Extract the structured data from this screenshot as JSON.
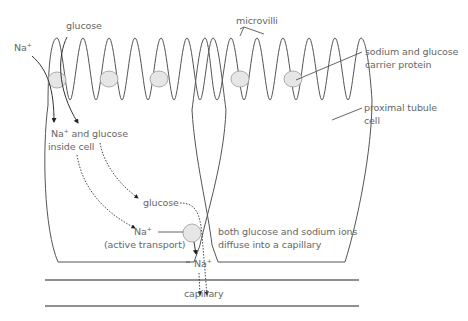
{
  "diagram": {
    "labels": {
      "glucose_top": "glucose",
      "na_top": "Na",
      "microvilli": "microvilli",
      "carrier_protein_line1": "sodium and glucose",
      "carrier_protein_line2": "carrier protein",
      "proximal_cell_line1": "proximal tubule",
      "proximal_cell_line2": "cell",
      "inside_cell_na": "Na",
      "inside_cell_line1": " and glucose",
      "inside_cell_line2": "inside cell",
      "glucose_mid": "glucose",
      "na_active": "Na",
      "active_transport": "(active transport)",
      "diffuse_line1": "both glucose and sodium ions",
      "diffuse_line2": "diffuse into a capillary",
      "na_bottom": "Na",
      "capillary": "capillary",
      "plus": "+"
    },
    "colors": {
      "line": "#555555",
      "text": "#666666",
      "carrier_fill": "#e6e6e6",
      "carrier_stroke": "#999999",
      "capillary_wall": "#222222"
    }
  }
}
